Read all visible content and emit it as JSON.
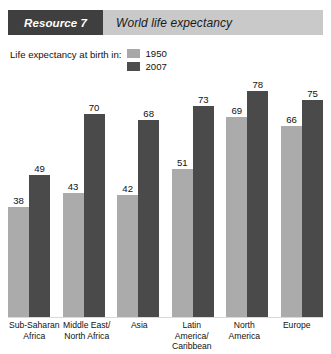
{
  "header": {
    "tag": "Resource 7",
    "title": "World life expectancy"
  },
  "legend": {
    "label": "Life expectancy at birth in:",
    "entries": [
      {
        "name": "1950",
        "color": "#ababab",
        "swatch_icon": "legend-swatch-1950"
      },
      {
        "name": "2007",
        "color": "#4a4a4a",
        "swatch_icon": "legend-swatch-2007"
      }
    ]
  },
  "chart_data": {
    "type": "bar",
    "title": "World life expectancy",
    "xlabel": "",
    "ylabel": "",
    "ylim": [
      0,
      85
    ],
    "grid": false,
    "legend_position": "top-left",
    "categories": [
      "Sub-Saharan\nAfrica",
      "Middle East/\nNorth Africa",
      "Asia",
      "Latin America/\nCaribbean",
      "North\nAmerica",
      "Europe"
    ],
    "series": [
      {
        "name": "1950",
        "color": "#ababab",
        "values": [
          38,
          43,
          42,
          51,
          69,
          66
        ]
      },
      {
        "name": "2007",
        "color": "#4a4a4a",
        "values": [
          49,
          70,
          68,
          73,
          78,
          75
        ]
      }
    ]
  }
}
